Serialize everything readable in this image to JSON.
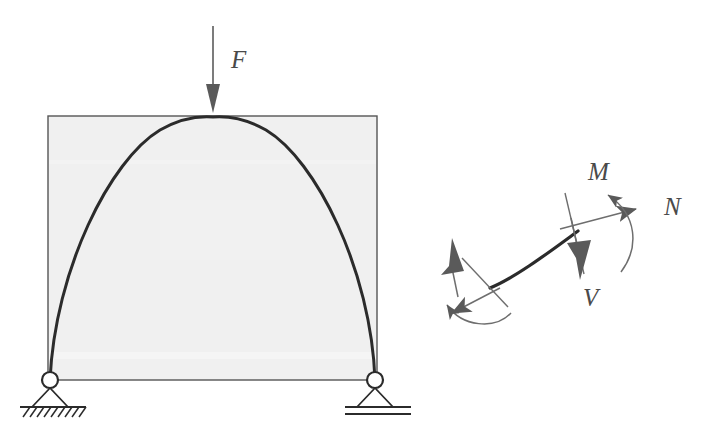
{
  "figure": {
    "background_color": "#ffffff",
    "ink_color": "#2b2b2b",
    "thin_line_color": "#6e6e6e",
    "arrow_fill_color": "#5a5a5a",
    "panel_fill_color": "#f0f0f0",
    "panel_border_color": "#555555"
  },
  "left_diagram": {
    "name": "arch-structure-diagram",
    "panel": {
      "label": "shaded-background-panel",
      "x": 48,
      "y": 116,
      "width": 329,
      "height": 264,
      "fill": "#f0f0f0",
      "stroke": "#555555"
    },
    "arch": {
      "label": "parabolic-arch-curve",
      "left_springing_x": 50,
      "left_springing_y": 380,
      "apex_x": 213,
      "apex_y": 118,
      "right_springing_x": 375,
      "right_springing_y": 380,
      "stroke_width": 3
    },
    "load": {
      "label": "F",
      "symbol": "F",
      "arrow_direction": "down",
      "tail_x": 213,
      "tail_y": 26,
      "head_x": 213,
      "head_y": 112,
      "label_x": 231,
      "label_y": 66
    },
    "supports": [
      {
        "name": "pin-support-left",
        "type": "pinned",
        "x": 50,
        "y": 380,
        "hinge_radius": 8,
        "base_y": 408,
        "hatched": true,
        "hatch_count": 9
      },
      {
        "name": "roller-support-right",
        "type": "roller",
        "x": 375,
        "y": 380,
        "hinge_radius": 8,
        "base_y": 408,
        "hatched": false,
        "double_line": true
      }
    ]
  },
  "right_diagram": {
    "name": "internal-forces-free-body-diagram",
    "arch_segment": {
      "label": "cut-arch-segment",
      "start_x": 490,
      "start_y": 287,
      "end_x": 578,
      "end_y": 231,
      "stroke_width": 3
    },
    "right_cut": {
      "name": "right-cut-face",
      "cut_face_x1": 565,
      "cut_face_y1": 194,
      "cut_face_x2": 583,
      "cut_face_y2": 272,
      "forces": [
        {
          "name": "normal-force-N-right",
          "symbol": "N",
          "direction": "up-right",
          "label_x": 664,
          "label_y": 213
        },
        {
          "name": "shear-force-V-right",
          "symbol": "V",
          "direction": "down",
          "label_x": 583,
          "label_y": 304
        },
        {
          "name": "bending-moment-M-right",
          "symbol": "M",
          "direction": "counterclockwise-curved",
          "label_x": 588,
          "label_y": 178
        }
      ]
    },
    "left_cut": {
      "name": "left-cut-face",
      "cut_face_x1": 463,
      "cut_face_y1": 260,
      "cut_face_x2": 506,
      "cut_face_y2": 305,
      "forces": [
        {
          "name": "normal-force-N-left",
          "symbol": "",
          "direction": "down-left"
        },
        {
          "name": "shear-force-V-left",
          "symbol": "",
          "direction": "up"
        },
        {
          "name": "bending-moment-M-left",
          "symbol": "",
          "direction": "clockwise-curved"
        }
      ]
    }
  },
  "labels": {
    "force": "F",
    "moment": "M",
    "normal": "N",
    "shear": "V"
  }
}
